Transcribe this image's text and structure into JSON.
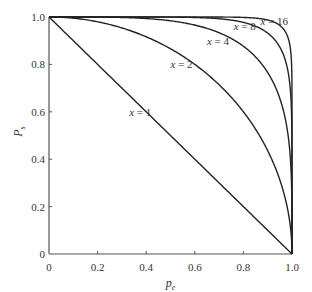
{
  "chart_data": {
    "type": "line",
    "title": "",
    "xlabel": "p_e",
    "ylabel": "P_s",
    "xlim": [
      0,
      1.0
    ],
    "ylim": [
      0,
      1.0
    ],
    "grid": false,
    "legend": "inline curve labels",
    "x_ticks": [
      "0",
      "0.2",
      "0.4",
      "0.6",
      "0.8",
      "1.0"
    ],
    "y_ticks": [
      "0",
      "0.2",
      "0.4",
      "0.6",
      "0.8",
      "1.0"
    ],
    "formula_note": "curves follow P_s = (1 - p_e^x)^(1/x)",
    "x": [
      0,
      0.1,
      0.2,
      0.3,
      0.4,
      0.5,
      0.6,
      0.7,
      0.8,
      0.9,
      0.95,
      0.98,
      1.0
    ],
    "series": [
      {
        "name": "x = 1",
        "x_param": 1,
        "label_pos": [
          0.33,
          0.6
        ],
        "values": [
          1.0,
          0.9,
          0.8,
          0.7,
          0.6,
          0.5,
          0.4,
          0.3,
          0.2,
          0.1,
          0.05,
          0.02,
          0.0
        ]
      },
      {
        "name": "x = 2",
        "x_param": 2,
        "label_pos": [
          0.5,
          0.8
        ],
        "values": [
          1.0,
          0.995,
          0.98,
          0.954,
          0.917,
          0.866,
          0.8,
          0.714,
          0.6,
          0.436,
          0.312,
          0.199,
          0.0
        ]
      },
      {
        "name": "x = 4",
        "x_param": 4,
        "label_pos": [
          0.65,
          0.9
        ],
        "values": [
          1.0,
          1.0,
          1.0,
          0.998,
          0.994,
          0.984,
          0.966,
          0.927,
          0.853,
          0.723,
          0.607,
          0.47,
          0.0
        ]
      },
      {
        "name": "x = 8",
        "x_param": 8,
        "label_pos": [
          0.76,
          0.96
        ],
        "values": [
          1.0,
          1.0,
          1.0,
          1.0,
          1.0,
          1.0,
          0.998,
          0.993,
          0.977,
          0.914,
          0.837,
          0.718,
          0.0
        ]
      },
      {
        "name": "x = 16",
        "x_param": 16,
        "label_pos": [
          0.87,
          0.985
        ],
        "values": [
          1.0,
          1.0,
          1.0,
          1.0,
          1.0,
          1.0,
          1.0,
          1.0,
          0.999,
          0.989,
          0.958,
          0.895,
          0.0
        ]
      }
    ]
  },
  "axes": {
    "x_title": "p",
    "x_title_sub": "e",
    "y_title": "P",
    "y_title_sub": "s"
  },
  "labels": {
    "var": "x",
    "eq": " = ",
    "values": [
      "1",
      "2",
      "4",
      "8",
      "16"
    ]
  }
}
